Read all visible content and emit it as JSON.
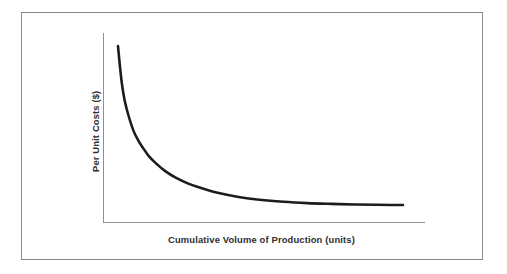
{
  "figure": {
    "background_color": "#ffffff",
    "frame_color": "#8a8a8a",
    "has_frame": true
  },
  "chart_data": {
    "type": "line",
    "title": "",
    "subtitle": "",
    "xlabel": "Cumulative Volume of Production (units)",
    "ylabel": "Per Unit Costs ($)",
    "curve_color": "#1c1c1c",
    "axis_color": "#8f8f8f",
    "grid": false,
    "legend": null,
    "legend_position": "none",
    "xlim": [
      0,
      100
    ],
    "ylim": [
      0,
      100
    ],
    "x_tick_labels": [],
    "y_tick_labels": [],
    "annotations": [],
    "series": [
      {
        "name": "Per Unit Costs",
        "x": [
          4.7,
          5.3,
          6.0,
          7.0,
          8.4,
          10.0,
          11.6,
          13.0,
          15.0,
          17.5,
          20.5,
          24.0,
          28.0,
          32.5,
          38.0,
          45.0,
          52.0,
          60.0,
          68.0,
          76.0,
          84.0,
          91.0,
          96.0,
          100.0
        ],
        "y": [
          93.0,
          83.0,
          73.0,
          63.5,
          55.0,
          47.5,
          42.5,
          39.0,
          34.5,
          30.5,
          26.5,
          23.0,
          20.0,
          17.5,
          15.0,
          12.8,
          11.3,
          10.2,
          9.5,
          9.1,
          8.8,
          8.6,
          8.5,
          8.5
        ]
      }
    ]
  },
  "layout": {
    "y_axis_x": 103,
    "y_axis_top": 33,
    "x_axis_y": 222,
    "x_axis_right": 425,
    "curve_start": [
      118,
      46
    ],
    "curve_end": [
      403,
      205
    ]
  }
}
